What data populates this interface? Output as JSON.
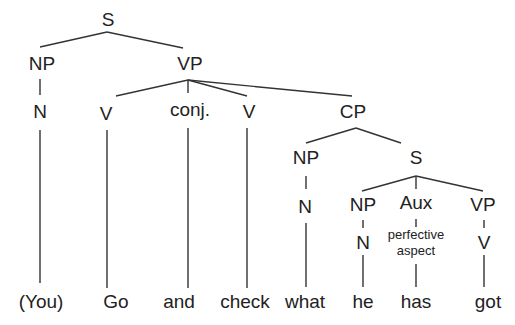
{
  "tree": {
    "root": "S",
    "nodes": {
      "s_top": "S",
      "np_subj": "NP",
      "vp_main": "VP",
      "n_subj": "N",
      "v_go": "V",
      "conj": "conj.",
      "v_check": "V",
      "cp": "CP",
      "np_wh": "NP",
      "s_embedded": "S",
      "n_wh": "N",
      "np_he": "NP",
      "aux": "Aux",
      "vp_embedded": "VP",
      "n_he": "N",
      "aux_note_line1": "perfective",
      "aux_note_line2": "aspect",
      "v_got": "V"
    },
    "words": [
      "(You)",
      "Go",
      "and",
      "check",
      "what",
      "he",
      "has",
      "got"
    ]
  }
}
